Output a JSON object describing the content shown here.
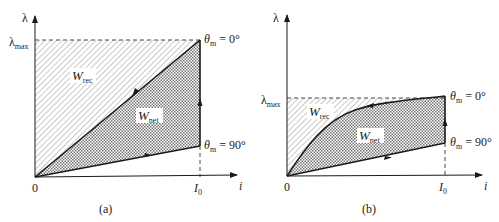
{
  "panels": [
    {
      "id": "a",
      "caption": "(a)",
      "y_axis_label": "λ",
      "x_axis_label": "i",
      "origin_label": "0",
      "y_mark_label": "λ",
      "y_mark_sub": "max",
      "x_mark_label": "I",
      "x_mark_sub": "0",
      "region_rec_label": "W",
      "region_rec_sub": "rec",
      "region_net_label": "W",
      "region_net_sub": "net",
      "upper_curve_label": "θ",
      "upper_curve_sub": "m",
      "upper_curve_value": " = 0°",
      "lower_curve_label": "θ",
      "lower_curve_sub": "m",
      "lower_curve_value": " = 90°",
      "upper_curve_shape": "linear"
    },
    {
      "id": "b",
      "caption": "(b)",
      "y_axis_label": "λ",
      "x_axis_label": "i",
      "origin_label": "0",
      "y_mark_label": "λ",
      "y_mark_sub": "max",
      "x_mark_label": "I",
      "x_mark_sub": "0",
      "region_rec_label": "W",
      "region_rec_sub": "rec",
      "region_net_label": "W",
      "region_net_sub": "net",
      "upper_curve_label": "θ",
      "upper_curve_sub": "m",
      "upper_curve_value": " = 0°",
      "lower_curve_label": "θ",
      "lower_curve_sub": "m",
      "lower_curve_value": " = 90°",
      "upper_curve_shape": "saturating"
    }
  ],
  "colors": {
    "line": "#1a1a1a",
    "hatch": "#8a8a8a",
    "crosshatch": "#6a6a6a",
    "text": "#222222"
  }
}
